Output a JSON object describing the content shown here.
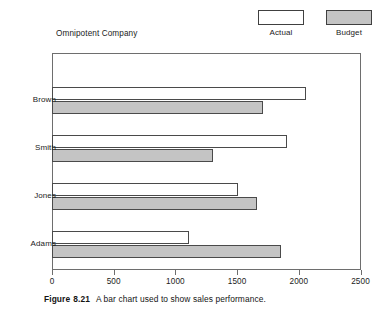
{
  "chart_data": {
    "type": "bar",
    "orientation": "horizontal",
    "title": "Omnipotent Company\nSales by Sales Manager ($000)\nFirst Quarter 1989",
    "title_lines": [
      "Omnipotent Company",
      "Sales by Sales Manager ($000)",
      "First Quarter 1989"
    ],
    "categories": [
      "Brown",
      "Smith",
      "Jones",
      "Adams"
    ],
    "series": [
      {
        "name": "Actual",
        "values": [
          2050,
          1900,
          1500,
          1100
        ],
        "color": "#ffffff"
      },
      {
        "name": "Budget",
        "values": [
          1700,
          1300,
          1650,
          1850
        ],
        "color": "#c4c4c4"
      }
    ],
    "xlabel": "",
    "ylabel": "",
    "xlim": [
      0,
      2500
    ],
    "xticks": [
      0,
      500,
      1000,
      1500,
      2000,
      2500
    ],
    "xtick_labels": [
      "0",
      "500",
      "1000",
      "1500",
      "2000",
      "2500"
    ],
    "grid": false,
    "legend_position": "top-right"
  },
  "legend": {
    "entries": [
      {
        "label": "Actual",
        "swatch": "actual"
      },
      {
        "label": "Budget",
        "swatch": "budget"
      }
    ]
  },
  "caption": {
    "figure_label": "Figure",
    "figure_number": "8.21",
    "text": "A bar chart used to show sales performance."
  },
  "colors": {
    "actual_fill": "#ffffff",
    "budget_fill": "#c4c4c4",
    "outline": "#4a4a4a",
    "frame": "#6e6e6e",
    "text": "#1b1b1b"
  }
}
